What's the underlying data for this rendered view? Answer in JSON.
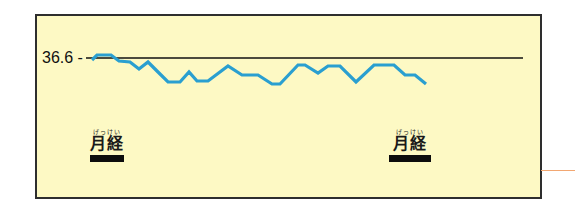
{
  "chart_data": {
    "type": "line",
    "title": "",
    "xlabel": "",
    "ylabel": "",
    "reference_line": {
      "value": 36.6,
      "label": "36.6",
      "color": "#111111"
    },
    "series": [
      {
        "name": "basal body temperature",
        "color": "#2a9fd0",
        "points_px": [
          [
            92,
            60
          ],
          [
            97,
            55
          ],
          [
            111,
            55
          ],
          [
            119,
            61
          ],
          [
            130,
            62
          ],
          [
            139,
            69
          ],
          [
            148,
            62
          ],
          [
            158,
            72
          ],
          [
            168,
            82
          ],
          [
            180,
            82
          ],
          [
            189,
            72
          ],
          [
            197,
            81
          ],
          [
            208,
            81
          ],
          [
            228,
            66
          ],
          [
            242,
            75
          ],
          [
            258,
            75
          ],
          [
            272,
            84
          ],
          [
            280,
            84
          ],
          [
            298,
            65
          ],
          [
            305,
            65
          ],
          [
            318,
            73
          ],
          [
            328,
            66
          ],
          [
            340,
            66
          ],
          [
            356,
            82
          ],
          [
            374,
            65
          ],
          [
            394,
            65
          ],
          [
            405,
            75
          ],
          [
            415,
            75
          ],
          [
            426,
            84
          ]
        ],
        "relative_values": [
          0.1,
          0.3,
          0.3,
          0.0,
          -0.05,
          -0.4,
          -0.05,
          -0.55,
          -1.05,
          -1.05,
          -0.55,
          -1.0,
          -1.0,
          -0.25,
          -0.7,
          -0.7,
          -1.15,
          -1.15,
          -0.2,
          -0.2,
          -0.6,
          -0.25,
          -0.25,
          -1.05,
          -0.2,
          -0.2,
          -0.7,
          -0.7,
          -1.15
        ]
      }
    ],
    "annotations": [
      {
        "label": "月経",
        "ruby": "げっけい",
        "x_px": 107,
        "meaning": "menstruation"
      },
      {
        "label": "月経",
        "ruby": "げっけい",
        "x_px": 410,
        "meaning": "menstruation"
      }
    ],
    "grid": false,
    "legend": "none"
  },
  "reference": {
    "label": "36.6 -"
  },
  "markers": [
    {
      "ruby": "げっけい",
      "label": "月経"
    },
    {
      "ruby": "げっけい",
      "label": "月経"
    }
  ],
  "colors": {
    "background": "#fdf9c4",
    "border": "#2e2e2e",
    "line": "#2a9fd0",
    "reference_line": "#111111",
    "marker_bar": "#0d0d0d",
    "leader_line": "#f2a772"
  }
}
